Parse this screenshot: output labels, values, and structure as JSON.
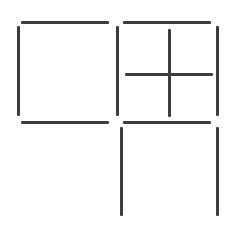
{
  "puzzle": {
    "type": "matchstick-squares",
    "stick_color": "#3d3d3d",
    "background": "#ffffff",
    "sticks": [
      {
        "id": "s1",
        "orientation": "h",
        "x": 21,
        "y": 21,
        "length": 88
      },
      {
        "id": "s2",
        "orientation": "v",
        "x": 17,
        "y": 26,
        "length": 90
      },
      {
        "id": "s3",
        "orientation": "v",
        "x": 116,
        "y": 26,
        "length": 90
      },
      {
        "id": "s4",
        "orientation": "h",
        "x": 21,
        "y": 121,
        "length": 88
      },
      {
        "id": "s5",
        "orientation": "h",
        "x": 123,
        "y": 21,
        "length": 88
      },
      {
        "id": "s6",
        "orientation": "v",
        "x": 216,
        "y": 26,
        "length": 90
      },
      {
        "id": "s7",
        "orientation": "v",
        "x": 168,
        "y": 29,
        "length": 88
      },
      {
        "id": "s8",
        "orientation": "h",
        "x": 125,
        "y": 73,
        "length": 88
      },
      {
        "id": "s9",
        "orientation": "h",
        "x": 123,
        "y": 121,
        "length": 88
      },
      {
        "id": "s10",
        "orientation": "v",
        "x": 120,
        "y": 127,
        "length": 89
      },
      {
        "id": "s11",
        "orientation": "v",
        "x": 216,
        "y": 127,
        "length": 89
      }
    ]
  }
}
